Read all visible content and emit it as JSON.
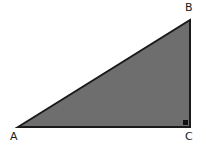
{
  "figure": {
    "name": "right-triangle-diagram",
    "background_color": "#ffffff",
    "width": 206,
    "height": 150
  },
  "triangle": {
    "fill_color": "#6e6e6e",
    "stroke_color": "#1a1a1a",
    "stroke_width": 2,
    "vertices": [
      {
        "id": "A",
        "label": "A",
        "x": 18,
        "y": 127,
        "position": "bottom-left"
      },
      {
        "id": "B",
        "label": "B",
        "x": 190,
        "y": 20,
        "position": "top-right"
      },
      {
        "id": "C",
        "label": "C",
        "x": 190,
        "y": 127,
        "position": "bottom-right"
      }
    ],
    "sides": [
      {
        "name": "base",
        "from": "A",
        "to": "C"
      },
      {
        "name": "vertical-leg",
        "from": "C",
        "to": "B"
      },
      {
        "name": "hypotenuse",
        "from": "B",
        "to": "A"
      }
    ]
  },
  "right_angle_marker": {
    "at_vertex": "C",
    "x": 183,
    "y": 120,
    "size": 5,
    "color": "#111111"
  },
  "labels": {
    "A": "A",
    "B": "B",
    "C": "C"
  }
}
